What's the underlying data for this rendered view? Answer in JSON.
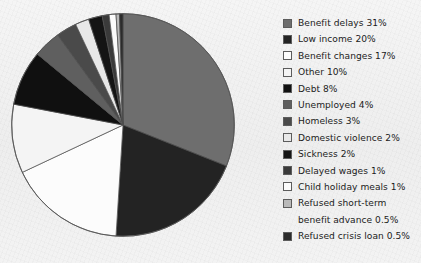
{
  "figure": {
    "background_color": "#f2f2f2",
    "text_color": "#1b1b1b"
  },
  "legend": {
    "position": "right",
    "items": [
      {
        "label": "Benefit delays 31%",
        "color": "#6e6e6e",
        "icon": "legend-swatch-icon"
      },
      {
        "label": "Low income 20%",
        "color": "#232323",
        "icon": "legend-swatch-icon"
      },
      {
        "label": "Benefit changes 17%",
        "color": "#fcfcfc",
        "icon": "legend-swatch-icon"
      },
      {
        "label": "Other 10%",
        "color": "#f4f4f4",
        "icon": "legend-swatch-icon"
      },
      {
        "label": "Debt 8%",
        "color": "#101010",
        "icon": "legend-swatch-icon"
      },
      {
        "label": "Unemployed 4%",
        "color": "#5f5f5f",
        "icon": "legend-swatch-icon"
      },
      {
        "label": "Homeless 3%",
        "color": "#4a4a4a",
        "icon": "legend-swatch-icon"
      },
      {
        "label": "Domestic violence 2%",
        "color": "#e8e8e8",
        "icon": "legend-swatch-icon"
      },
      {
        "label": "Sickness 2%",
        "color": "#141414",
        "icon": "legend-swatch-icon"
      },
      {
        "label": "Delayed wages 1%",
        "color": "#3a3a3a",
        "icon": "legend-swatch-icon"
      },
      {
        "label": "Child holiday meals 1%",
        "color": "#fbfbfb",
        "icon": "legend-swatch-icon"
      },
      {
        "label": "Refused short-term\nbenefit advance 0.5%",
        "color": "#b9b9b9",
        "icon": "legend-swatch-icon"
      },
      {
        "label": "Refused crisis loan 0.5%",
        "color": "#2b2b2b",
        "icon": "legend-swatch-icon"
      }
    ]
  },
  "chart_data": {
    "type": "pie",
    "title": "",
    "subtitle": "",
    "xlabel": "",
    "ylabel": "",
    "grid": false,
    "legend_position": "right",
    "start_angle_deg": 0,
    "direction": "clockwise",
    "value_unit": "percent",
    "total": 100,
    "center_px": [
      133,
      131
    ],
    "radius_px": 112,
    "categories": [
      "Benefit delays",
      "Low income",
      "Benefit changes",
      "Other",
      "Debt",
      "Unemployed",
      "Homeless",
      "Domestic violence",
      "Sickness",
      "Delayed wages",
      "Child holiday meals",
      "Refused short-term benefit advance",
      "Refused crisis loan"
    ],
    "values": [
      31,
      20,
      17,
      10,
      8,
      4,
      3,
      2,
      2,
      1,
      1,
      0.5,
      0.5
    ],
    "labels": [
      "Benefit delays 31%",
      "Low income 20%",
      "Benefit changes 17%",
      "Other 10%",
      "Debt 8%",
      "Unemployed 4%",
      "Homeless 3%",
      "Domestic violence 2%",
      "Sickness 2%",
      "Delayed wages 1%",
      "Child holiday meals 1%",
      "Refused short-term benefit advance 0.5%",
      "Refused crisis loan 0.5%"
    ],
    "colors": [
      "#6e6e6e",
      "#232323",
      "#fcfcfc",
      "#f4f4f4",
      "#101010",
      "#5f5f5f",
      "#4a4a4a",
      "#e8e8e8",
      "#141414",
      "#3a3a3a",
      "#fbfbfb",
      "#b9b9b9",
      "#2b2b2b"
    ]
  }
}
